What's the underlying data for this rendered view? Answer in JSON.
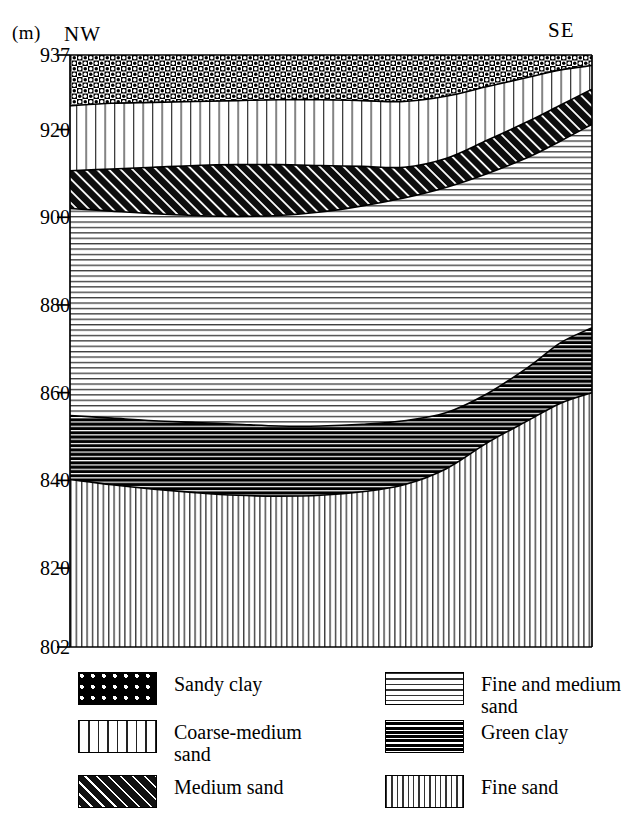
{
  "figure": {
    "type": "geological-cross-section",
    "axis_unit_label": "(m)",
    "direction_left": "NW",
    "direction_right": "SE",
    "y_axis": {
      "label": "(m)",
      "min": 802,
      "max": 937,
      "ticks": [
        937,
        920,
        900,
        880,
        860,
        840,
        820,
        802
      ]
    },
    "plot_box": {
      "left": 70,
      "top": 55,
      "right": 592,
      "bottom": 647
    },
    "colors": {
      "ink": "#000000",
      "paper": "#ffffff"
    }
  },
  "legend": {
    "columns": [
      {
        "items": [
          {
            "pattern": "checkerboard",
            "label": "Sandy clay"
          },
          {
            "pattern": "sparse-vertical-lines",
            "label": "Coarse-medium\nsand"
          },
          {
            "pattern": "diagonal-hatch",
            "label": "Medium sand"
          }
        ]
      },
      {
        "items": [
          {
            "pattern": "horizontal-lines",
            "label": "Fine and medium\nsand"
          },
          {
            "pattern": "dense-dark-horizontal",
            "label": "Green clay"
          },
          {
            "pattern": "dense-vertical-lines",
            "label": "Fine sand"
          }
        ]
      }
    ]
  },
  "chart_data": {
    "type": "area",
    "title": "",
    "xlabel": "",
    "ylabel": "(m)",
    "ylim": [
      802,
      937
    ],
    "grid": false,
    "legend_position": "bottom",
    "x_endpoints": [
      "NW",
      "SE"
    ],
    "x": [
      0,
      0.08,
      0.16,
      0.24,
      0.32,
      0.4,
      0.48,
      0.56,
      0.64,
      0.72,
      0.8,
      0.88,
      0.94,
      1.0
    ],
    "surface_elevation_m": 937,
    "boundaries_m": {
      "note": "Elevation (m) of the base of each unit, sampled left(NW) to right(SE)",
      "base_of_sandy_clay": [
        925.4,
        926.0,
        926.2,
        926.4,
        926.6,
        926.8,
        926.8,
        926.6,
        926.4,
        927.6,
        929.8,
        932.0,
        933.6,
        934.6
      ],
      "base_of_coarse_medium": [
        910.6,
        911.0,
        911.4,
        911.8,
        912.0,
        912.0,
        911.8,
        911.6,
        911.4,
        913.4,
        917.6,
        922.0,
        925.6,
        929.2
      ],
      "base_of_medium_sand": [
        902.0,
        901.4,
        900.8,
        900.4,
        900.2,
        900.4,
        901.2,
        902.6,
        904.4,
        906.8,
        910.0,
        913.8,
        917.4,
        921.2
      ],
      "base_of_fine_medium": [
        854.8,
        854.2,
        853.6,
        853.2,
        852.8,
        852.4,
        852.4,
        852.8,
        853.6,
        855.4,
        859.8,
        866.0,
        871.4,
        874.8
      ],
      "base_of_green_clay": [
        840.2,
        839.0,
        838.0,
        837.2,
        836.6,
        836.4,
        836.6,
        837.4,
        839.0,
        842.6,
        848.6,
        853.8,
        857.6,
        860.0
      ],
      "base_of_fine_sand": [
        802,
        802,
        802,
        802,
        802,
        802,
        802,
        802,
        802,
        802,
        802,
        802,
        802,
        802
      ]
    },
    "units_top_to_bottom": [
      "Sandy clay",
      "Coarse-medium sand",
      "Medium sand",
      "Fine and medium sand",
      "Green clay",
      "Fine sand"
    ]
  }
}
